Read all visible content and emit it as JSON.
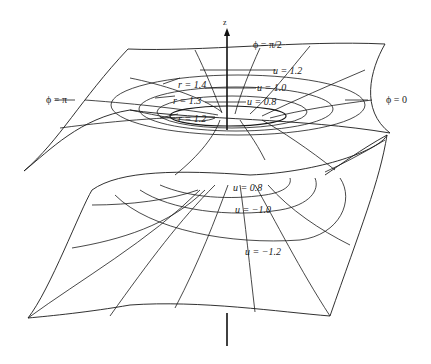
{
  "diagram": {
    "axis": {
      "label": "z"
    },
    "labels": {
      "phi_half_pi": "ϕ = π/2",
      "phi_pi": "ϕ = π",
      "phi_zero": "ϕ = 0",
      "r_14": "r = 1.4",
      "r_13": "r = 1.3",
      "r_12": "r = 1.2",
      "u_12": "u = 1.2",
      "u_10": "u = 1.0",
      "u_08_top": "u = 0.8",
      "u_08_bottom": "u = 0.8",
      "u_m10": "u = −1.0",
      "u_m12": "u = −1.2"
    },
    "colors": {
      "ink": "#1a1a1a",
      "background": "#ffffff"
    }
  }
}
